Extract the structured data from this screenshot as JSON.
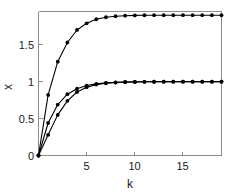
{
  "chart_data": {
    "type": "line",
    "title": "",
    "xlabel": "k",
    "ylabel": "x",
    "xlim": [
      0,
      19
    ],
    "ylim": [
      0,
      1.95
    ],
    "grid": false,
    "legend": null,
    "xticks": [
      5,
      10,
      15
    ],
    "xtick_labels": [
      "5",
      "10",
      "15"
    ],
    "yticks": [
      0,
      0.5,
      1,
      1.5
    ],
    "ytick_labels": [
      "0",
      "0.5",
      "1",
      "1.5"
    ],
    "marker": "filled-circle",
    "x": [
      0,
      1,
      2,
      3,
      4,
      5,
      6,
      7,
      8,
      9,
      10,
      11,
      12,
      13,
      14,
      15,
      16,
      17,
      18,
      19
    ],
    "series": [
      {
        "name": "upper",
        "asymptote": 1.9,
        "values": [
          0,
          0.82,
          1.27,
          1.53,
          1.7,
          1.79,
          1.845,
          1.872,
          1.886,
          1.893,
          1.897,
          1.899,
          1.9,
          1.9,
          1.9,
          1.9,
          1.9,
          1.9,
          1.9,
          1.9
        ]
      },
      {
        "name": "middle",
        "asymptote": 1.0,
        "values": [
          0,
          0.44,
          0.69,
          0.83,
          0.905,
          0.947,
          0.97,
          0.983,
          0.99,
          0.995,
          0.997,
          0.998,
          0.999,
          1.0,
          1.0,
          1.0,
          1.0,
          1.0,
          1.0,
          1.0
        ]
      },
      {
        "name": "lower",
        "asymptote": 1.0,
        "values": [
          0,
          0.28,
          0.55,
          0.74,
          0.86,
          0.925,
          0.96,
          0.978,
          0.988,
          0.993,
          0.996,
          0.998,
          0.999,
          1.0,
          1.0,
          1.0,
          1.0,
          1.0,
          1.0,
          1.0
        ]
      }
    ]
  },
  "axis": {
    "xlabel": "k",
    "ylabel": "x"
  },
  "colors": {
    "line": "#000000",
    "frame": "#8c8c8c",
    "text": "#1a1a1a",
    "background": "#ffffff"
  }
}
